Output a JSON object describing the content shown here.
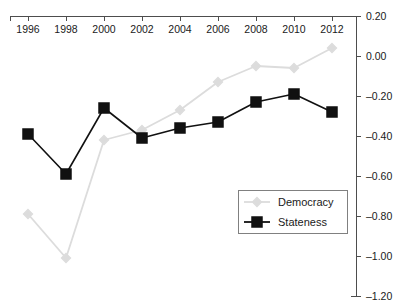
{
  "chart_data": {
    "type": "line",
    "title": "",
    "subtitle": "",
    "xlabel": "",
    "ylabel": "",
    "x": [
      1996,
      1998,
      2000,
      2002,
      2004,
      2006,
      2008,
      2010,
      2012
    ],
    "xtick_labels": [
      "1996",
      "1998",
      "2000",
      "2002",
      "2004",
      "2006",
      "2008",
      "2010",
      "2012"
    ],
    "ytick_labels": [
      "0.20",
      "0.00",
      "-0.20",
      "-0.40",
      "-0.60",
      "-0.80",
      "-1.00",
      "-1.20"
    ],
    "ytick_values": [
      0.2,
      0.0,
      -0.2,
      -0.4,
      -0.6,
      -0.8,
      -1.0,
      -1.2
    ],
    "xlim": [
      1995.05,
      1913.0
    ],
    "ylim": [
      -1.2,
      0.2
    ],
    "grid": false,
    "xaxis_position": "top",
    "yaxis_position": "right",
    "legend_position": "bottom-right",
    "series": [
      {
        "name": "Democracy",
        "color": "#dcdcdc",
        "marker": "diamond",
        "values": [
          -0.79,
          -1.01,
          -0.42,
          -0.37,
          -0.27,
          -0.13,
          -0.05,
          -0.06,
          0.04
        ]
      },
      {
        "name": "Stateness",
        "color": "#111111",
        "marker": "square",
        "values": [
          -0.39,
          -0.59,
          -0.26,
          -0.41,
          -0.36,
          -0.33,
          -0.23,
          -0.19,
          -0.28
        ]
      }
    ]
  },
  "legend": {
    "entries": [
      {
        "label": "Democracy"
      },
      {
        "label": "Stateness"
      }
    ]
  }
}
